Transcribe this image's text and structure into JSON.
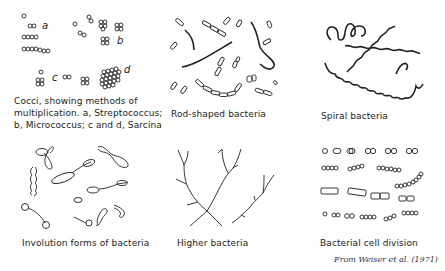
{
  "figure": {
    "panels": [
      {
        "id": "cocci",
        "caption_lines": [
          "Cocci, showing methods of",
          "multiplication.  a, Streptococcus;",
          "b, Micrococcus;  c and d, Sarcina"
        ],
        "letters": [
          "a",
          "b",
          "c",
          "d"
        ]
      },
      {
        "id": "rods",
        "caption_lines": [
          "Rod-shaped bacteria"
        ]
      },
      {
        "id": "spiral",
        "caption_lines": [
          "Spiral bacteria"
        ]
      },
      {
        "id": "involution",
        "caption_lines": [
          "Involution forms of bacteria"
        ]
      },
      {
        "id": "higher",
        "caption_lines": [
          "Higher bacteria"
        ]
      },
      {
        "id": "division",
        "caption_lines": [
          "Bacterial cell division"
        ]
      }
    ],
    "credit": "From Weiser et al. (1971)"
  }
}
